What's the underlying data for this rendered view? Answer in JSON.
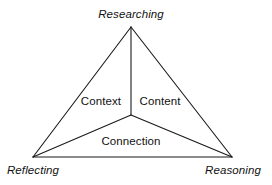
{
  "diagram": {
    "type": "triangle-framework",
    "background_color": "#ffffff",
    "line_color": "#1a1a1a",
    "line_width": 1,
    "vertices": {
      "top": {
        "label": "Researching",
        "x": 131,
        "y": 27,
        "style": "italic"
      },
      "bottom_left": {
        "label": "Reflecting",
        "x": 33,
        "y": 157,
        "style": "italic"
      },
      "bottom_right": {
        "label": "Reasoning",
        "x": 232,
        "y": 157,
        "style": "italic"
      }
    },
    "center": {
      "x": 131,
      "y": 115
    },
    "regions": {
      "left": {
        "label": "Context",
        "style": "regular"
      },
      "right": {
        "label": "Content",
        "style": "regular"
      },
      "bottom": {
        "label": "Connection",
        "style": "regular"
      }
    },
    "edges": [
      {
        "name": "top-to-bottom-left",
        "from": "top",
        "to": "bottom_left"
      },
      {
        "name": "top-to-bottom-right",
        "from": "top",
        "to": "bottom_right"
      },
      {
        "name": "bottom-left-to-bottom-right",
        "from": "bottom_left",
        "to": "bottom_right"
      }
    ],
    "spokes": [
      {
        "name": "center-to-top",
        "from": "center",
        "to": "top"
      },
      {
        "name": "center-to-bottom-left",
        "from": "center",
        "to": "bottom_left"
      },
      {
        "name": "center-to-bottom-right",
        "from": "center",
        "to": "bottom_right"
      }
    ]
  }
}
